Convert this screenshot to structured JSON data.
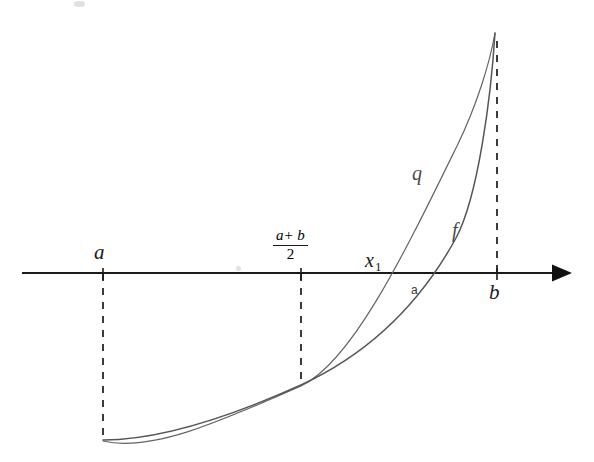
{
  "figure": {
    "background_color": "#ffffff",
    "axis": {
      "name": "x-axis",
      "color": "#1a1a1a",
      "y": 273,
      "x_start": 22,
      "x_end": 570,
      "has_arrowhead": true,
      "arrow_direction": "right"
    },
    "labels": {
      "point_a": "a",
      "midpoint_numerator": "a+ b",
      "midpoint_denominator": "2",
      "root_x1": "x",
      "root_x1_subscript": "1",
      "root_small_a": "a",
      "point_b": "b",
      "curve_q": "q",
      "curve_f": "f"
    },
    "tick_marks": [
      {
        "name": "tick-a",
        "x": 103
      },
      {
        "name": "tick-midpoint",
        "x": 301
      },
      {
        "name": "tick-b",
        "x": 497
      }
    ],
    "dashed_lines": [
      {
        "name": "dashed-a",
        "x": 103,
        "y_from": 273,
        "y_to": 440,
        "direction": "down"
      },
      {
        "name": "dashed-midpoint",
        "x": 301,
        "y_from": 273,
        "y_to": 386,
        "direction": "down"
      },
      {
        "name": "dashed-b",
        "x": 497,
        "y_from": 273,
        "y_to": 40,
        "direction": "up"
      }
    ],
    "curves": [
      {
        "name": "curve-q",
        "label": "q",
        "color": "#646464",
        "stroke_width": 1.2,
        "description": "interpolating quadratic through (a, f(a)), midpoint and (b, f(b))",
        "axis_crossing_x": 390,
        "path": "M 103,441 C 150,452 215,424 301,386 C 352,362 404,254 457,146 C 477,105 490,62 495,33"
      },
      {
        "name": "curve-f",
        "label": "f",
        "color": "#555555",
        "stroke_width": 1.5,
        "description": "convex function f passing through (a, f(a)), midpoint and (b, f(b))",
        "axis_crossing_x": 413,
        "path": "M 103,440 C 160,440 232,416 301,385 C 368,354 420,304 456,238 C 478,197 491,97 495,33"
      }
    ]
  }
}
